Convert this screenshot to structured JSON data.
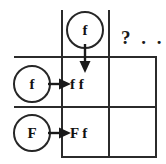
{
  "diagram": {
    "type": "punnett-square",
    "line_color": "#2b2b2b",
    "background_color": "#ffffff",
    "text_color": "#111111"
  },
  "top_gametes": [
    {
      "label": "f",
      "name": "top-gamete-f"
    }
  ],
  "side_gametes": [
    {
      "label": "f",
      "name": "side-gamete-f"
    },
    {
      "label": "F",
      "name": "side-gamete-F"
    }
  ],
  "cells": [
    {
      "row": 0,
      "col": 0,
      "genotype": "f f",
      "filled": true
    },
    {
      "row": 0,
      "col": 1,
      "genotype": "",
      "filled": false
    },
    {
      "row": 1,
      "col": 0,
      "genotype": "F f",
      "filled": true
    },
    {
      "row": 1,
      "col": 1,
      "genotype": "",
      "filled": false
    }
  ],
  "annotations": {
    "question_marker": "? . ."
  }
}
